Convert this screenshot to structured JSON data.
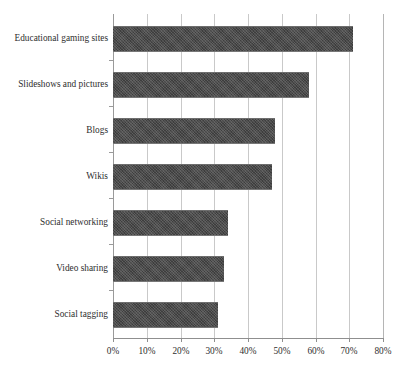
{
  "chart_data": {
    "type": "bar",
    "orientation": "horizontal",
    "title": "",
    "subtitle": "",
    "xlabel": "",
    "ylabel": "",
    "categories": [
      "Educational gaming sites",
      "Slideshows and pictures",
      "Blogs",
      "Wikis",
      "Social networking",
      "Video sharing",
      "Social tagging"
    ],
    "values": [
      71,
      58,
      48,
      47,
      34,
      33,
      31
    ],
    "value_unit": "%",
    "xlim": [
      0,
      80
    ],
    "xticks": [
      0,
      10,
      20,
      30,
      40,
      50,
      60,
      70,
      80
    ],
    "xtick_labels": [
      "0%",
      "10%",
      "20%",
      "30%",
      "40%",
      "50%",
      "60%",
      "70%",
      "80%"
    ],
    "grid": true,
    "grid_axis": "x",
    "legend": false,
    "legend_position": "none",
    "series": [
      {
        "name": "",
        "values": [
          71,
          58,
          48,
          47,
          34,
          33,
          31
        ],
        "color": "#4b4b4b"
      }
    ]
  },
  "style": {
    "bar_color": "#4b4b4b",
    "gridline_color": "#c9c9c9",
    "axis_color": "#8f8f8f",
    "text_color": "#2e2e2e",
    "background": "#ffffff"
  }
}
